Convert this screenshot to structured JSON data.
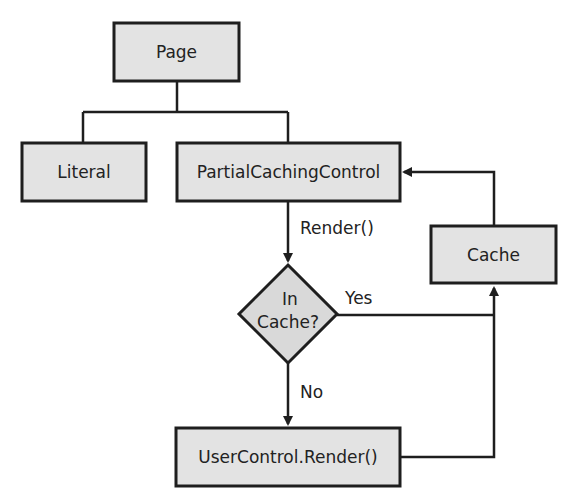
{
  "diagram": {
    "type": "flowchart",
    "nodes": {
      "page": {
        "label": "Page",
        "shape": "rectangle"
      },
      "literal": {
        "label": "Literal",
        "shape": "rectangle"
      },
      "partial_caching_control": {
        "label": "PartialCachingControl",
        "shape": "rectangle"
      },
      "cache": {
        "label": "Cache",
        "shape": "rectangle"
      },
      "decision": {
        "line1": "In",
        "line2": "Cache?",
        "shape": "diamond"
      },
      "user_control_render": {
        "label": "UserControl.Render()",
        "shape": "rectangle"
      }
    },
    "edges": {
      "page_to_children": {
        "from": "Page",
        "to": [
          "Literal",
          "PartialCachingControl"
        ],
        "arrow": false
      },
      "render": {
        "from": "PartialCachingControl",
        "to": "In Cache?",
        "label": "Render()"
      },
      "yes": {
        "from": "In Cache?",
        "to": "Cache",
        "label": "Yes"
      },
      "no": {
        "from": "In Cache?",
        "to": "UserControl.Render()",
        "label": "No"
      },
      "ucr_to_cache": {
        "from": "UserControl.Render()",
        "to": "Cache",
        "label": ""
      },
      "cache_to_pcc": {
        "from": "Cache",
        "to": "PartialCachingControl",
        "label": ""
      }
    },
    "colors": {
      "box_fill": "#e3e3e3",
      "diamond_fill": "#d9d9d9",
      "stroke": "#1e1e1e",
      "text": "#222222",
      "background": "#ffffff"
    }
  }
}
